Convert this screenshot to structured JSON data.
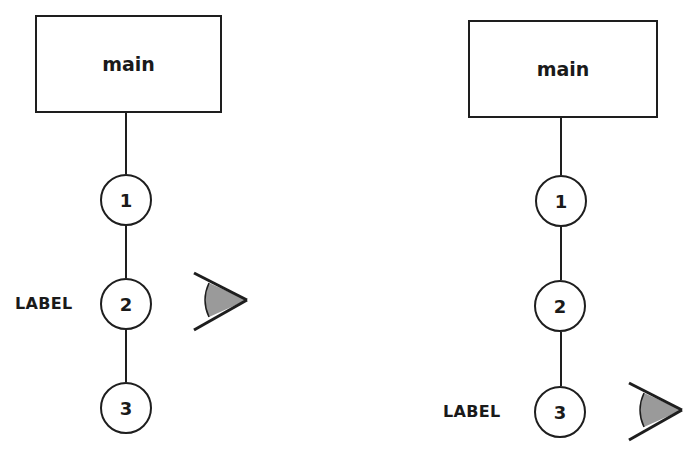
{
  "diagrams": [
    {
      "id": "left",
      "root": {
        "label": "main"
      },
      "nodes": [
        {
          "label": "1"
        },
        {
          "label": "2"
        },
        {
          "label": "3"
        }
      ],
      "annotation": {
        "label": "LABEL",
        "attached_to_node": "2"
      },
      "viewer": {
        "icon": "eye-icon",
        "attached_to_node": "2"
      }
    },
    {
      "id": "right",
      "root": {
        "label": "main"
      },
      "nodes": [
        {
          "label": "1"
        },
        {
          "label": "2"
        },
        {
          "label": "3"
        }
      ],
      "annotation": {
        "label": "LABEL",
        "attached_to_node": "3"
      },
      "viewer": {
        "icon": "eye-icon",
        "attached_to_node": "3"
      }
    }
  ],
  "colors": {
    "stroke": "#1e1e1e",
    "eye_fill": "#9a9a9a",
    "background": "#ffffff"
  }
}
